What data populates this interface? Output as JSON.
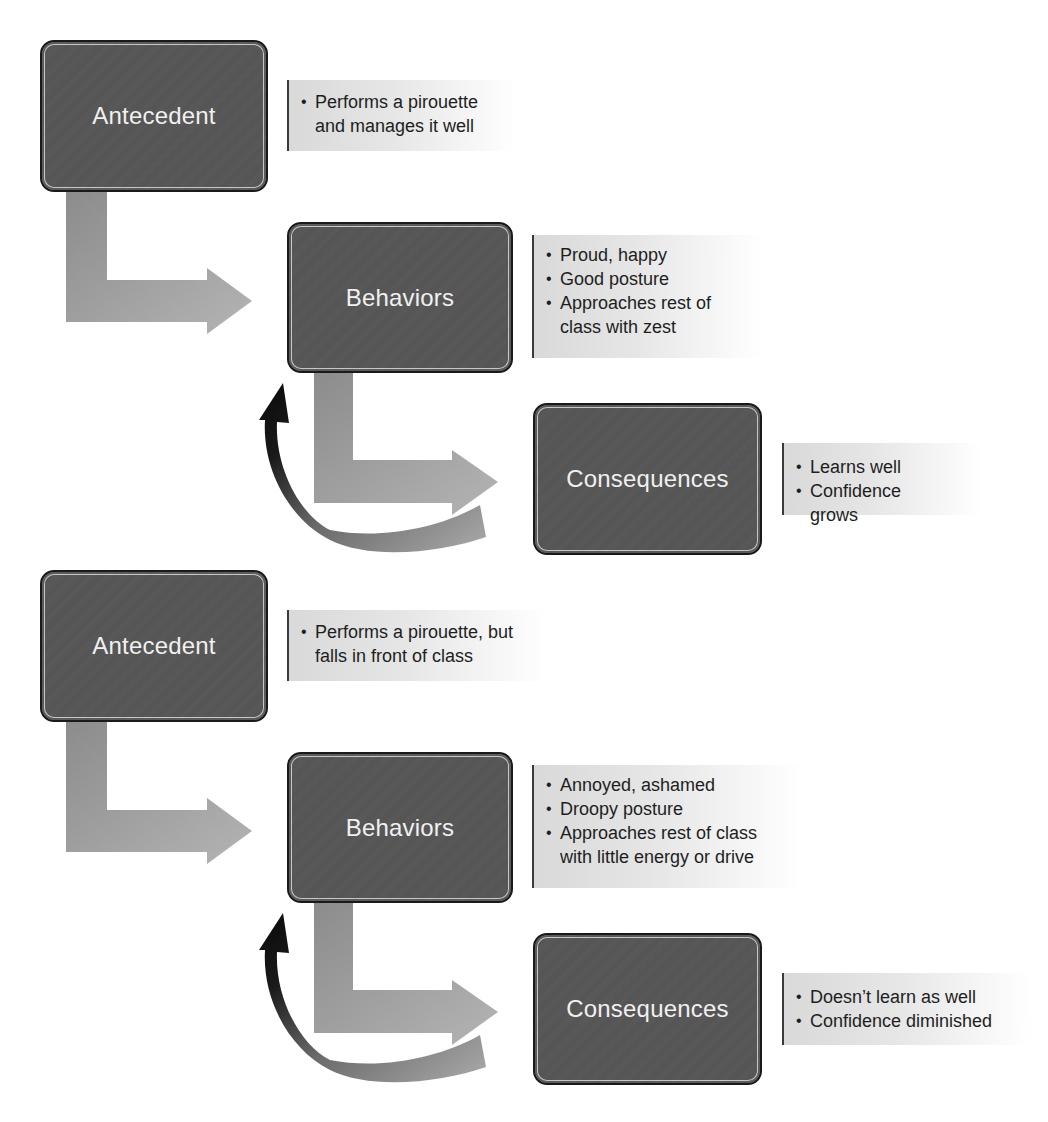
{
  "diagrams": [
    {
      "id": "positive",
      "antecedent": {
        "label": "Antecedent",
        "notes": [
          "Performs a pirouette and manages it well"
        ]
      },
      "behaviors": {
        "label": "Behaviors",
        "notes": [
          "Proud, happy",
          "Good posture",
          "Approaches rest of class with zest"
        ]
      },
      "consequences": {
        "label": "Consequences",
        "notes": [
          "Learns well",
          "Confidence grows"
        ]
      }
    },
    {
      "id": "negative",
      "antecedent": {
        "label": "Antecedent",
        "notes": [
          "Performs a pirouette, but falls in front of class"
        ]
      },
      "behaviors": {
        "label": "Behaviors",
        "notes": [
          "Annoyed, ashamed",
          "Droopy posture",
          "Approaches rest of class with little energy or drive"
        ]
      },
      "consequences": {
        "label": "Consequences",
        "notes": [
          "Doesn’t learn as well",
          "Confidence diminished"
        ]
      }
    }
  ],
  "colors": {
    "box_fill": "#565656",
    "box_border": "#1a1a1a",
    "box_text": "#f4f4f4",
    "flow_arrow": "#9a9a9a",
    "feedback_arrow": "#111111",
    "note_text": "#1e1e1e"
  }
}
